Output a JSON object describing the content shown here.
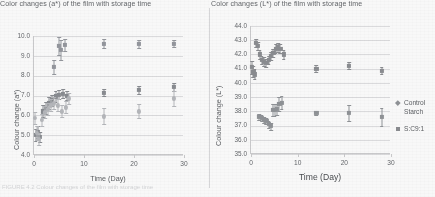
{
  "figure": {
    "caption_fragment": "FIGURE 4.2 Colour changes of the film with storage time"
  },
  "charts": [
    {
      "id": "a-star",
      "title": "Color changes (a*) of the film with storage time",
      "xlabel": "Time (Day)",
      "ylabel": "Colour change (a*)",
      "yticks": [
        "10.0",
        "9.0",
        "8.0",
        "7.0",
        "6.0",
        "5.0",
        "4.0"
      ],
      "xticks": [
        "0",
        "10",
        "20",
        "30"
      ]
    },
    {
      "id": "l-star",
      "title": "Color changes (L*) of the film with storage time",
      "xlabel": "Time (Day)",
      "ylabel": "Colour change (L*)",
      "yticks": [
        "44.0",
        "43.0",
        "42.0",
        "41.0",
        "40.0",
        "39.0",
        "38.0",
        "37.0",
        "36.0",
        "35.0"
      ],
      "xticks": [
        "0",
        "10",
        "20",
        "30"
      ],
      "legend": {
        "items": [
          {
            "label": "Control Starch",
            "label_line1": "Control",
            "label_line2": "Starch",
            "marker": "diamond",
            "color": "#8c8f93"
          },
          {
            "label": "S:C9:1",
            "marker": "square",
            "color": "#87898d"
          }
        ]
      }
    }
  ],
  "chart_data": [
    {
      "type": "scatter",
      "title": "Color changes (a*) of the film with storage time",
      "xlabel": "Time (Day)",
      "ylabel": "Colour change (a*)",
      "xlim": [
        0,
        30
      ],
      "ylim": [
        4.0,
        10.0
      ],
      "xticks": [
        0,
        10,
        20,
        30
      ],
      "yticks": [
        4.0,
        5.0,
        6.0,
        7.0,
        8.0,
        9.0,
        10.0
      ],
      "grid": "horizontal",
      "legend": "none",
      "series": [
        {
          "name": "high-series",
          "marker": "diamond",
          "color": "#90939a",
          "points": [
            {
              "x": 4,
              "y": 8.45,
              "err": 0.35
            },
            {
              "x": 5,
              "y": 9.5,
              "err": 0.45
            },
            {
              "x": 5.4,
              "y": 9.3,
              "err": 0.5
            },
            {
              "x": 6.2,
              "y": 9.55,
              "err": 0.3
            },
            {
              "x": 14,
              "y": 9.62,
              "err": 0.22
            },
            {
              "x": 21,
              "y": 9.6,
              "err": 0.2
            },
            {
              "x": 28,
              "y": 9.62,
              "err": 0.2
            }
          ]
        },
        {
          "name": "mid-series",
          "marker": "square",
          "color": "#85888d",
          "points": [
            {
              "x": 0.3,
              "y": 5.0,
              "err": 0.3
            },
            {
              "x": 0.8,
              "y": 5.15,
              "err": 0.3
            },
            {
              "x": 1.2,
              "y": 4.9,
              "err": 0.25
            },
            {
              "x": 1.8,
              "y": 6.2,
              "err": 0.3
            },
            {
              "x": 2.4,
              "y": 6.35,
              "err": 0.3
            },
            {
              "x": 3.0,
              "y": 6.6,
              "err": 0.3
            },
            {
              "x": 3.6,
              "y": 6.75,
              "err": 0.3
            },
            {
              "x": 4.3,
              "y": 6.95,
              "err": 0.3
            },
            {
              "x": 5.0,
              "y": 7.05,
              "err": 0.25
            },
            {
              "x": 5.8,
              "y": 7.1,
              "err": 0.25
            },
            {
              "x": 6.6,
              "y": 7.0,
              "err": 0.25
            },
            {
              "x": 14,
              "y": 7.15,
              "err": 0.2
            },
            {
              "x": 21,
              "y": 7.3,
              "err": 0.2
            },
            {
              "x": 28,
              "y": 7.45,
              "err": 0.2
            }
          ]
        },
        {
          "name": "low-series",
          "marker": "circle",
          "color": "#b3b5b9",
          "points": [
            {
              "x": 0.2,
              "y": 5.85,
              "err": 0.3
            },
            {
              "x": 0.6,
              "y": 5.1,
              "err": 0.35
            },
            {
              "x": 1.0,
              "y": 4.8,
              "err": 0.3
            },
            {
              "x": 1.6,
              "y": 5.75,
              "err": 0.3
            },
            {
              "x": 2.2,
              "y": 6.15,
              "err": 0.3
            },
            {
              "x": 2.8,
              "y": 6.3,
              "err": 0.3
            },
            {
              "x": 3.4,
              "y": 6.5,
              "err": 0.3
            },
            {
              "x": 4.0,
              "y": 6.6,
              "err": 0.3
            },
            {
              "x": 4.8,
              "y": 6.5,
              "err": 0.3
            },
            {
              "x": 5.6,
              "y": 6.2,
              "err": 0.3
            },
            {
              "x": 6.4,
              "y": 6.4,
              "err": 0.3
            },
            {
              "x": 7.0,
              "y": 6.85,
              "err": 0.3
            },
            {
              "x": 14,
              "y": 5.95,
              "err": 0.4
            },
            {
              "x": 21,
              "y": 6.2,
              "err": 0.35
            },
            {
              "x": 28,
              "y": 6.85,
              "err": 0.4
            }
          ]
        }
      ]
    },
    {
      "type": "scatter",
      "title": "Color changes (L*) of the film with storage time",
      "xlabel": "Time (Day)",
      "ylabel": "Colour change (L*)",
      "xlim": [
        0,
        30
      ],
      "ylim": [
        35.0,
        44.0
      ],
      "xticks": [
        0,
        10,
        20,
        30
      ],
      "yticks": [
        35.0,
        36.0,
        37.0,
        38.0,
        39.0,
        40.0,
        41.0,
        42.0,
        43.0,
        44.0
      ],
      "grid": "horizontal",
      "legend": "right",
      "series": [
        {
          "name": "S:C9:1",
          "marker": "square",
          "color": "#87898d",
          "points": [
            {
              "x": 0.2,
              "y": 41.1,
              "err": 0.45
            },
            {
              "x": 0.5,
              "y": 40.8,
              "err": 0.4
            },
            {
              "x": 0.8,
              "y": 40.6,
              "err": 0.35
            },
            {
              "x": 1.1,
              "y": 42.8,
              "err": 0.3
            },
            {
              "x": 1.5,
              "y": 42.6,
              "err": 0.3
            },
            {
              "x": 1.9,
              "y": 42.0,
              "err": 0.3
            },
            {
              "x": 2.3,
              "y": 41.6,
              "err": 0.3
            },
            {
              "x": 2.8,
              "y": 41.5,
              "err": 0.3
            },
            {
              "x": 3.3,
              "y": 41.4,
              "err": 0.3
            },
            {
              "x": 3.8,
              "y": 41.6,
              "err": 0.3
            },
            {
              "x": 4.3,
              "y": 41.9,
              "err": 0.3
            },
            {
              "x": 4.8,
              "y": 42.1,
              "err": 0.3
            },
            {
              "x": 5.3,
              "y": 42.4,
              "err": 0.3
            },
            {
              "x": 5.8,
              "y": 42.5,
              "err": 0.3
            },
            {
              "x": 6.3,
              "y": 42.4,
              "err": 0.3
            },
            {
              "x": 7.0,
              "y": 42.0,
              "err": 0.3
            },
            {
              "x": 14,
              "y": 41.0,
              "err": 0.25
            },
            {
              "x": 21,
              "y": 41.2,
              "err": 0.25
            },
            {
              "x": 28,
              "y": 40.85,
              "err": 0.25
            }
          ]
        },
        {
          "name": "Control Starch",
          "marker": "diamond",
          "color": "#8c8f93",
          "points": [
            {
              "x": 1.8,
              "y": 37.6,
              "err": 0.2
            },
            {
              "x": 2.3,
              "y": 37.55,
              "err": 0.2
            },
            {
              "x": 2.8,
              "y": 37.4,
              "err": 0.2
            },
            {
              "x": 3.3,
              "y": 37.3,
              "err": 0.2
            },
            {
              "x": 3.8,
              "y": 37.1,
              "err": 0.25
            },
            {
              "x": 4.3,
              "y": 36.95,
              "err": 0.25
            },
            {
              "x": 4.7,
              "y": 38.1,
              "err": 0.4
            },
            {
              "x": 5.1,
              "y": 38.1,
              "err": 0.4
            },
            {
              "x": 5.6,
              "y": 38.15,
              "err": 0.4
            },
            {
              "x": 6.1,
              "y": 38.5,
              "err": 0.5
            },
            {
              "x": 6.6,
              "y": 38.6,
              "err": 0.45
            },
            {
              "x": 14,
              "y": 37.9,
              "err": 0.15
            },
            {
              "x": 21,
              "y": 37.9,
              "err": 0.55
            },
            {
              "x": 28,
              "y": 37.6,
              "err": 0.65
            }
          ]
        }
      ]
    }
  ]
}
